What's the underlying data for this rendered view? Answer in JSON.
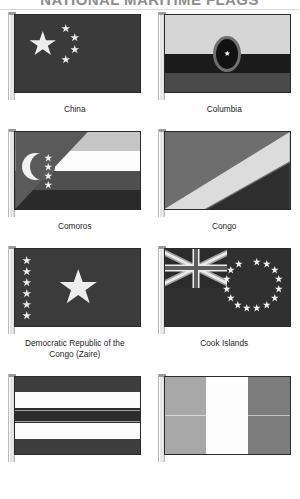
{
  "header": {
    "title": "NATIONAL MARITIME FLAGS"
  },
  "flags": [
    {
      "name": "China",
      "caption_line1": "China",
      "caption_line2": "",
      "design": "red field with one large yellow star and four small stars in an arc",
      "colors": {
        "field": "#3a3a3a",
        "star": "#ededed"
      }
    },
    {
      "name": "Columbia",
      "caption_line1": "Columbia",
      "caption_line2": "",
      "design": "horizontal bands with central oval emblem and white star",
      "colors": {
        "top": "#d6d6d6",
        "middle": "#1b1b1b",
        "bottom": "#4a4a4a",
        "emblem_ring": "#6f6f6f"
      }
    },
    {
      "name": "Comoros",
      "caption_line1": "Comoros",
      "caption_line2": "",
      "design": "four horizontal bands with green hoist triangle, crescent and four stars",
      "colors": {
        "band1": "#c6c6c6",
        "band2": "#fdfdfd",
        "band3": "#4f4f4f",
        "band4": "#2a2a2a",
        "triangle": "#5a5a5a"
      }
    },
    {
      "name": "Congo",
      "caption_line1": "Congo",
      "caption_line2": "",
      "design": "diagonal tricolor green, yellow, red",
      "colors": {
        "green": "#6e6e6e",
        "yellow": "#dcdcdc",
        "red": "#2e2e2e"
      }
    },
    {
      "name": "Democratic Republic of the Congo (Zaire)",
      "caption_line1": "Democratic Republic of the",
      "caption_line2": "Congo (Zaire)",
      "design": "blue field with six small stars at hoist and one large central star",
      "colors": {
        "field": "#3b3b3b",
        "star": "#ededed"
      }
    },
    {
      "name": "Cook Islands",
      "caption_line1": "Cook Islands",
      "caption_line2": "",
      "design": "blue ensign with Union Jack canton and ring of fifteen stars",
      "colors": {
        "field": "#303030",
        "star": "#f0f0f0"
      }
    },
    {
      "name": "Costa Rica",
      "caption_line1": "",
      "caption_line2": "",
      "design": "five horizontal stripes blue white red white blue",
      "colors": {
        "stripe_dark": "#3e3e3e",
        "stripe_light": "#fbfbfb",
        "stripe_center": "#2c2c2c"
      }
    },
    {
      "name": "Cote d'Ivoire",
      "caption_line1": "",
      "caption_line2": "",
      "design": "vertical tricolor orange white green",
      "colors": {
        "left": "#a8a8a8",
        "center": "#fdfdfd",
        "right": "#7c7c7c"
      }
    }
  ]
}
